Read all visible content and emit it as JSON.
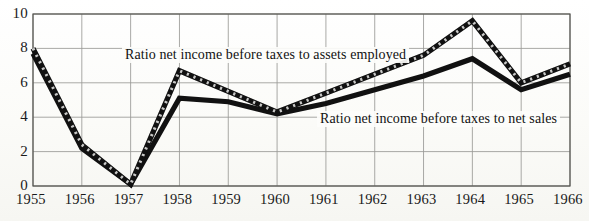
{
  "chart_data": {
    "type": "line",
    "title": "",
    "xlabel": "",
    "ylabel": "",
    "x": [
      1955,
      1956,
      1957,
      1958,
      1959,
      1960,
      1961,
      1962,
      1963,
      1964,
      1965,
      1966
    ],
    "categories": [
      "1955",
      "1956",
      "1957",
      "1958",
      "1959",
      "1960",
      "1961",
      "1962",
      "1963",
      "1964",
      "1965",
      "1966"
    ],
    "xlim": [
      1955,
      1966
    ],
    "ylim": [
      0,
      10
    ],
    "yticks": [
      0,
      2,
      4,
      6,
      8,
      10
    ],
    "ytick_labels": [
      "0",
      "2",
      "4",
      "6",
      "8",
      "10"
    ],
    "grid": true,
    "legend_position": "inline-annotations",
    "series": [
      {
        "name": "Ratio net income before taxes to assets employed",
        "style": "dashed-thick",
        "color": "#111111",
        "values": [
          8.0,
          2.4,
          0.1,
          6.7,
          5.5,
          4.3,
          5.4,
          6.5,
          7.6,
          9.6,
          6.0,
          7.1
        ]
      },
      {
        "name": "Ratio net income before taxes to net sales",
        "style": "solid-thick",
        "color": "#111111",
        "values": [
          7.7,
          2.2,
          0.1,
          5.1,
          4.9,
          4.2,
          4.8,
          5.6,
          6.4,
          7.4,
          5.6,
          6.5
        ]
      }
    ],
    "annotations": [
      {
        "text": "Ratio net income before taxes to assets employed",
        "series": "Ratio net income before taxes to assets employed",
        "x_px": 122,
        "y_px": 47
      },
      {
        "text": "Ratio net income before taxes to net sales",
        "series": "Ratio net income before taxes to net sales",
        "x_px": 317,
        "y_px": 111
      }
    ]
  },
  "axes": {
    "y_tick_labels": [
      "10",
      "8",
      "6",
      "4",
      "2",
      "0"
    ],
    "x_tick_labels": [
      "1955",
      "1956",
      "1957",
      "1958",
      "1959",
      "1960",
      "1961",
      "1962",
      "1963",
      "1964",
      "1965",
      "1966"
    ]
  },
  "colors": {
    "line": "#111111",
    "grid": "#9a9a96",
    "frame": "#555550",
    "background": "#fdfdfb",
    "text": "#1a1a1a"
  }
}
